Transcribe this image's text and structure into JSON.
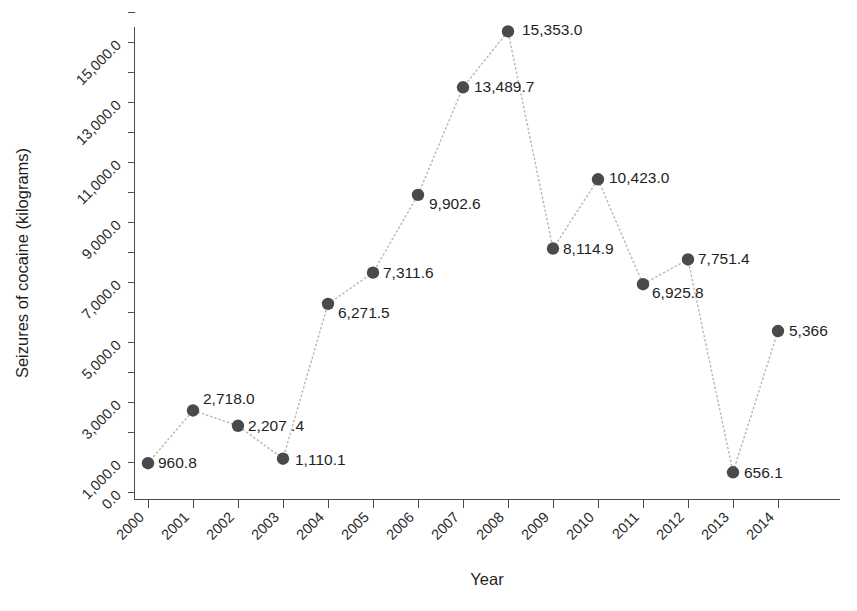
{
  "chart_data": {
    "type": "scatter",
    "title": "",
    "xlabel": "Year",
    "ylabel": "Seizures of cocaine (kilograms)",
    "categories": [
      "2000",
      "2001",
      "2002",
      "2003",
      "2004",
      "2005",
      "2006",
      "2007",
      "2008",
      "2009",
      "2010",
      "2011",
      "2012",
      "2013",
      "2014"
    ],
    "values": [
      960.8,
      2718.0,
      2207.4,
      1110.1,
      6271.5,
      7311.6,
      9902.6,
      13489.7,
      15353.0,
      8114.9,
      10423.0,
      6925.8,
      7751.4,
      656.1,
      5366
    ],
    "point_labels": [
      "960.8",
      "2,718.0",
      "2,207 .4",
      "1,110.1",
      "6,271.5",
      "7,311.6",
      "9,902.6",
      "13,489.7",
      "15,353.0",
      "8,114.9",
      "10,423.0",
      "6,925.8",
      "7,751.4",
      "656.1",
      "5,366"
    ],
    "ylim": [
      0,
      16000
    ],
    "ytick_values": [
      0,
      1000,
      2000,
      3000,
      4000,
      5000,
      6000,
      7000,
      8000,
      9000,
      10000,
      11000,
      12000,
      13000,
      14000,
      15000,
      16000
    ],
    "ytick_labels": [
      {
        "value": 0,
        "text": "0.0"
      },
      {
        "value": 1000,
        "text": "1,000.0"
      },
      {
        "value": 3000,
        "text": "3,000.0"
      },
      {
        "value": 5000,
        "text": "5,000.0"
      },
      {
        "value": 7000,
        "text": "7,000.0"
      },
      {
        "value": 9000,
        "text": "9,000.0"
      },
      {
        "value": 11000,
        "text": "11,000.0"
      },
      {
        "value": 13000,
        "text": "13,000.0"
      },
      {
        "value": 15000,
        "text": "15,000.0"
      }
    ],
    "grid": false,
    "legend": false,
    "line_style": "dotted",
    "marker": "circle",
    "colors": {
      "marker": "#4a4a4a",
      "line": "#b9b9b9",
      "axis": "#4d4d4d",
      "text": "#1f1f1f",
      "background": "#ffffff"
    },
    "x_tick_rotation": -45,
    "y_tick_rotation": -45
  },
  "axes": {
    "x_title": "Year",
    "y_title": "Seizures of cocaine (kilograms)"
  }
}
